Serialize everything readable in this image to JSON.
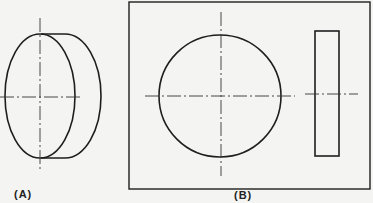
{
  "figure": {
    "view_a": {
      "label": "(A)",
      "description": "pictorial view of a cylinder (disc)"
    },
    "view_b": {
      "label": "(B)",
      "description": "orthographic views: front (circle) and side (rectangle)"
    }
  },
  "colors": {
    "line": "#1e1e1e",
    "background": "#f4f4f2"
  }
}
